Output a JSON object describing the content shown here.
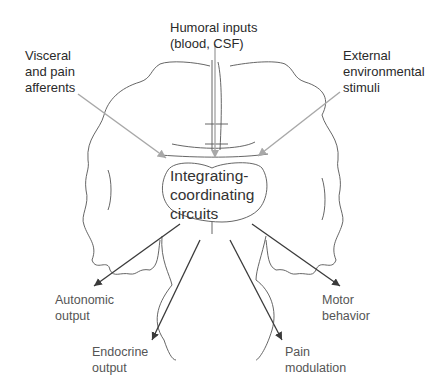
{
  "diagram": {
    "center_label": "Integrating-\ncoordinating\ncircuits",
    "inputs": [
      {
        "id": "humoral",
        "label": "Humoral inputs\n(blood, CSF)"
      },
      {
        "id": "visceral",
        "label": "Visceral\nand pain\nafferents"
      },
      {
        "id": "external",
        "label": "External\nenvironmental\nstimuli"
      }
    ],
    "outputs": [
      {
        "id": "autonomic",
        "label": "Autonomic\noutput"
      },
      {
        "id": "endocrine",
        "label": "Endocrine\noutput"
      },
      {
        "id": "pain",
        "label": "Pain\nmodulation"
      },
      {
        "id": "motor",
        "label": "Motor\nbehavior"
      }
    ],
    "colors": {
      "input_arrow": "#a8a8a8",
      "output_arrow": "#3a3a3a",
      "outline": "#555555",
      "input_text": "#2a2a2a",
      "output_text": "#555555"
    }
  }
}
